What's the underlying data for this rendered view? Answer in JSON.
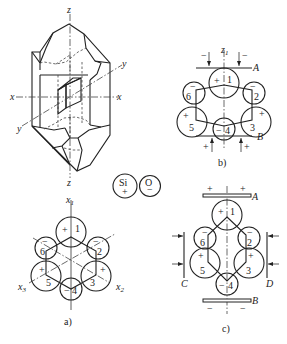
{
  "figure": {
    "type": "quartz crystal piezoelectric effect diagram",
    "crystal": {
      "axes": {
        "x_left": "x",
        "x_right": "x",
        "y_upper": "y",
        "y_lower": "y",
        "z_top": "z",
        "z_bottom": "z"
      }
    },
    "legend": {
      "si": {
        "symbol": "Si",
        "charge": "+"
      },
      "o": {
        "symbol": "O",
        "charge": "−"
      }
    },
    "panel_a": {
      "caption": "a)",
      "axes": {
        "x1": "x",
        "x1_sub": "1",
        "x2": "x",
        "x2_sub": "2",
        "x3": "x",
        "x3_sub": "3"
      },
      "atoms": [
        {
          "num": "1",
          "charge": "+"
        },
        {
          "num": "2",
          "charge": "−"
        },
        {
          "num": "3",
          "charge": "+"
        },
        {
          "num": "4",
          "charge": "−"
        },
        {
          "num": "5",
          "charge": "+"
        },
        {
          "num": "6",
          "charge": "−"
        }
      ]
    },
    "panel_b": {
      "caption": "b)",
      "axis": {
        "name": "z",
        "sub": "1"
      },
      "plate_top": "A",
      "plate_bottom": "B",
      "top_force_signs": [
        "−",
        "−"
      ],
      "bottom_force_signs": [
        "+",
        "+"
      ],
      "atoms": [
        {
          "num": "1",
          "charge": "+"
        },
        {
          "num": "2",
          "charge": "−"
        },
        {
          "num": "3",
          "charge": "+"
        },
        {
          "num": "4",
          "charge": "−"
        },
        {
          "num": "5",
          "charge": "+"
        },
        {
          "num": "6",
          "charge": "−"
        }
      ]
    },
    "panel_c": {
      "caption": "c)",
      "plate_top": "A",
      "plate_bottom": "B",
      "plate_left": "C",
      "plate_right": "D",
      "top_plate_signs": [
        "+",
        "+"
      ],
      "bottom_plate_signs": [
        "−",
        "−"
      ],
      "atoms": [
        {
          "num": "1",
          "charge": "+"
        },
        {
          "num": "2",
          "charge": "−"
        },
        {
          "num": "3",
          "charge": "+"
        },
        {
          "num": "4",
          "charge": "−"
        },
        {
          "num": "5",
          "charge": "+"
        },
        {
          "num": "6",
          "charge": "−"
        }
      ]
    }
  }
}
